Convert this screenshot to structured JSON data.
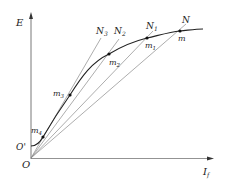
{
  "axes": {
    "y_label": "E",
    "x_label": "I",
    "x_label_sub": "f",
    "origin_label": "O",
    "offset_label": "O'"
  },
  "points": {
    "m": "m",
    "m1": "m",
    "m1_sub": "1",
    "m2": "m",
    "m2_sub": "2",
    "m3": "m",
    "m3_sub": "3",
    "m4": "m",
    "m4_sub": "4"
  },
  "line_ends": {
    "N": "N",
    "N1": "N",
    "N1_sub": "1",
    "N2": "N",
    "N2_sub": "2",
    "N3": "N",
    "N3_sub": "3"
  },
  "colors": {
    "curve": "#222222",
    "axis": "#555555",
    "rays": "#8a8a8a"
  }
}
